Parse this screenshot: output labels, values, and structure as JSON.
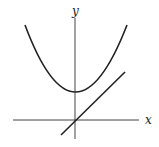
{
  "diagram": {
    "type": "function-graph",
    "axes": {
      "x_label": "x",
      "y_label": "y",
      "origin_px": [
        75,
        120
      ],
      "x_range_px": [
        13,
        139
      ],
      "y_range_px": [
        18,
        139
      ]
    },
    "curves": [
      {
        "name": "parabola",
        "description": "upward-opening parabola with vertex on positive y-axis",
        "vertex_px": [
          75,
          92
        ],
        "left_end_px": [
          25,
          25
        ],
        "right_end_px": [
          127,
          25
        ]
      },
      {
        "name": "line",
        "description": "line through origin with positive slope",
        "start_px": [
          61,
          135
        ],
        "end_px": [
          125,
          72
        ]
      }
    ],
    "stroke_color": "#222222"
  }
}
